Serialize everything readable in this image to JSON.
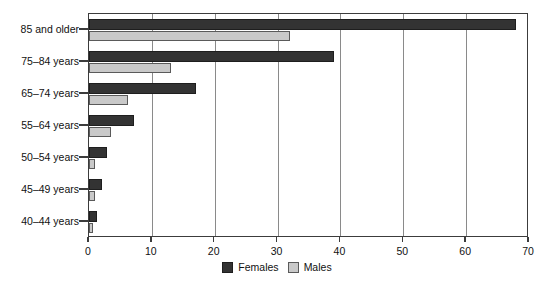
{
  "chart_data": {
    "type": "bar",
    "orientation": "horizontal",
    "title": "",
    "subtitle": "",
    "xlabel": "",
    "ylabel": "",
    "xlim": [
      0,
      70
    ],
    "xticks": [
      0,
      10,
      20,
      30,
      40,
      50,
      60,
      70
    ],
    "xtick_labels": [
      "0",
      "10",
      "20",
      "30",
      "40",
      "50",
      "60",
      "70"
    ],
    "grid": "vertical",
    "legend_position": "bottom-center",
    "categories": [
      "40–44 years",
      "45–49 years",
      "50–54 years",
      "55–64 years",
      "65–74 years",
      "75–84 years",
      "85 and older"
    ],
    "series": [
      {
        "name": "Females",
        "color": "#333333",
        "values": [
          1.2,
          2.0,
          2.9,
          7.2,
          17.0,
          39.0,
          68.0
        ]
      },
      {
        "name": "Males",
        "color": "#c9c9c9",
        "values": [
          0.6,
          0.9,
          0.9,
          3.5,
          6.2,
          13.0,
          32.0
        ]
      }
    ],
    "legend": [
      "Females",
      "Males"
    ]
  },
  "legend": {
    "items": [
      {
        "label": "Females",
        "swatch": "female"
      },
      {
        "label": "Males",
        "swatch": "male"
      }
    ]
  },
  "colors": {
    "female": "#333333",
    "male": "#c9c9c9",
    "axis": "#3c3c3c",
    "grid": "#8a8a8a",
    "background": "#ffffff",
    "text": "#111111"
  }
}
